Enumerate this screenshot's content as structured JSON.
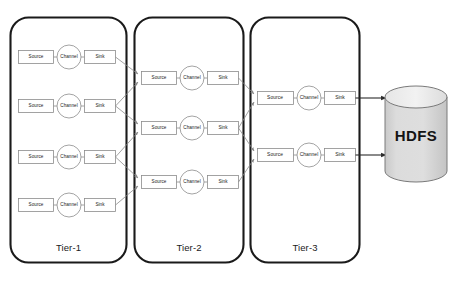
{
  "diagram": {
    "colors": {
      "tier_border": "#1a1a1a",
      "node_border": "#8c8c8c",
      "connector": "#8c8c8c",
      "arrow_dark": "#2b2b2b",
      "cylinder_fill": "#d9d9d9",
      "cylinder_stroke": "#7a7a7a",
      "background": "#ffffff"
    },
    "node_labels": {
      "source": "Source",
      "channel": "Channel",
      "sink": "Sink"
    },
    "tiers": [
      {
        "id": "tier-1",
        "label": "Tier-1",
        "agent_count": 4,
        "agents": [
          {
            "source": "Source",
            "channel": "Channel",
            "sink": "Sink"
          },
          {
            "source": "Source",
            "channel": "Channel",
            "sink": "Sink"
          },
          {
            "source": "Source",
            "channel": "Channel",
            "sink": "Sink"
          },
          {
            "source": "Source",
            "channel": "Channel",
            "sink": "Sink"
          }
        ]
      },
      {
        "id": "tier-2",
        "label": "Tier-2",
        "agent_count": 3,
        "agents": [
          {
            "source": "Source",
            "channel": "Channel",
            "sink": "Sink"
          },
          {
            "source": "Source",
            "channel": "Channel",
            "sink": "Sink"
          },
          {
            "source": "Source",
            "channel": "Channel",
            "sink": "Sink"
          }
        ]
      },
      {
        "id": "tier-3",
        "label": "Tier-3",
        "agent_count": 2,
        "agents": [
          {
            "source": "Source",
            "channel": "Channel",
            "sink": "Sink"
          },
          {
            "source": "Source",
            "channel": "Channel",
            "sink": "Sink"
          }
        ]
      }
    ],
    "storage": {
      "label": "HDFS",
      "shape": "cylinder"
    }
  }
}
